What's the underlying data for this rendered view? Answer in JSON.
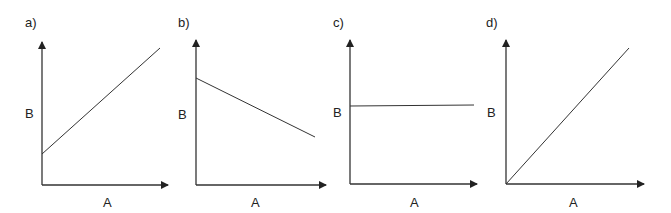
{
  "panels": [
    {
      "id": "a",
      "label": "a)",
      "xlabel": "A",
      "ylabel": "B",
      "relationship": "linear increasing, positive intercept",
      "line": {
        "x1": 42,
        "y1": 154,
        "x2": 160,
        "y2": 48
      },
      "origin": {
        "x": 42,
        "y": 185
      },
      "yaxis_top": 40,
      "xaxis_end": 170,
      "label_pos": {
        "x": 25,
        "y": 27
      },
      "ylabel_pos": {
        "x": 25,
        "y": 118
      },
      "xlabel_pos": {
        "x": 103,
        "y": 207
      }
    },
    {
      "id": "b",
      "label": "b)",
      "xlabel": "A",
      "ylabel": "B",
      "relationship": "linear decreasing",
      "line": {
        "x1": 196,
        "y1": 78,
        "x2": 315,
        "y2": 137
      },
      "origin": {
        "x": 196,
        "y": 185
      },
      "yaxis_top": 38,
      "xaxis_end": 328,
      "label_pos": {
        "x": 178,
        "y": 27
      },
      "ylabel_pos": {
        "x": 178,
        "y": 119
      },
      "xlabel_pos": {
        "x": 251,
        "y": 207
      }
    },
    {
      "id": "c",
      "label": "c)",
      "xlabel": "A",
      "ylabel": "B",
      "relationship": "constant",
      "line": {
        "x1": 350,
        "y1": 106,
        "x2": 474,
        "y2": 105
      },
      "origin": {
        "x": 350,
        "y": 184
      },
      "yaxis_top": 38,
      "xaxis_end": 479,
      "label_pos": {
        "x": 333,
        "y": 27
      },
      "ylabel_pos": {
        "x": 333,
        "y": 117
      },
      "xlabel_pos": {
        "x": 410,
        "y": 207
      }
    },
    {
      "id": "d",
      "label": "d)",
      "xlabel": "A",
      "ylabel": "B",
      "relationship": "directly proportional through origin",
      "line": {
        "x1": 506,
        "y1": 184,
        "x2": 629,
        "y2": 48
      },
      "origin": {
        "x": 506,
        "y": 184
      },
      "yaxis_top": 38,
      "xaxis_end": 646,
      "label_pos": {
        "x": 486,
        "y": 27
      },
      "ylabel_pos": {
        "x": 487,
        "y": 117
      },
      "xlabel_pos": {
        "x": 569,
        "y": 207
      }
    }
  ],
  "colors": {
    "axis": "#333333",
    "line": "#333333",
    "text": "#222222",
    "background": "#ffffff"
  }
}
